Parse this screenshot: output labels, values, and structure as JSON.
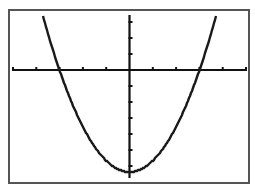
{
  "chart_data": {
    "type": "line",
    "title": "",
    "xlabel": "",
    "ylabel": "",
    "grid": false,
    "legend": null,
    "x_ticks_units": [
      -5,
      -4,
      -3,
      -2,
      -1,
      0,
      1,
      2,
      3,
      4,
      5
    ],
    "y_ticks_units_above": [
      1,
      2,
      3
    ],
    "y_ticks_units_below": [
      -1,
      -2,
      -3,
      -4,
      -5,
      -6
    ],
    "series": [
      {
        "name": "parabola",
        "x_intercepts_units": [
          -3,
          3
        ],
        "vertex_units": [
          0,
          -6.4
        ],
        "color": "#1a1a1a"
      }
    ]
  },
  "layout": {
    "frame": {
      "x": 9,
      "y": 10,
      "w": 240,
      "h": 173,
      "color": "#555555"
    },
    "origin_px": {
      "x": 129.5,
      "y": 70
    },
    "x_tick_spacing_px": 23.3,
    "y_tick_spacing_px": 16,
    "axis_color": "#111111",
    "curve": {
      "vertex_px_y": 172,
      "a_px": 0.0208
    }
  }
}
